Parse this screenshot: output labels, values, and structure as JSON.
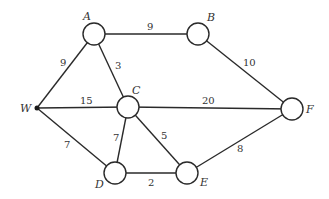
{
  "diagram": {
    "type": "weighted-undirected-graph",
    "nodes": [
      {
        "id": "A",
        "label": "A",
        "x": 94,
        "y": 34,
        "shape": "circle",
        "label_x": 83,
        "label_y": 20
      },
      {
        "id": "B",
        "label": "B",
        "x": 198,
        "y": 34,
        "shape": "circle",
        "label_x": 207,
        "label_y": 21
      },
      {
        "id": "W",
        "label": "W",
        "x": 37,
        "y": 108,
        "shape": "dot",
        "label_x": 20,
        "label_y": 112
      },
      {
        "id": "C",
        "label": "C",
        "x": 128,
        "y": 107,
        "shape": "circle",
        "label_x": 132,
        "label_y": 94
      },
      {
        "id": "F",
        "label": "F",
        "x": 292,
        "y": 109,
        "shape": "circle",
        "label_x": 306,
        "label_y": 113
      },
      {
        "id": "D",
        "label": "D",
        "x": 115,
        "y": 173,
        "shape": "circle",
        "label_x": 95,
        "label_y": 188
      },
      {
        "id": "E",
        "label": "E",
        "x": 187,
        "y": 173,
        "shape": "circle",
        "label_x": 200,
        "label_y": 186
      }
    ],
    "edges": [
      {
        "from": "A",
        "to": "B",
        "weight": "9",
        "label_x": 147,
        "label_y": 30
      },
      {
        "from": "W",
        "to": "A",
        "weight": "9",
        "label_x": 60,
        "label_y": 66
      },
      {
        "from": "A",
        "to": "C",
        "weight": "3",
        "label_x": 115,
        "label_y": 69
      },
      {
        "from": "B",
        "to": "F",
        "weight": "10",
        "label_x": 243,
        "label_y": 66
      },
      {
        "from": "W",
        "to": "C",
        "weight": "15",
        "label_x": 80,
        "label_y": 104
      },
      {
        "from": "C",
        "to": "F",
        "weight": "20",
        "label_x": 202,
        "label_y": 104
      },
      {
        "from": "W",
        "to": "D",
        "weight": "7",
        "label_x": 64,
        "label_y": 148
      },
      {
        "from": "C",
        "to": "D",
        "weight": "7",
        "label_x": 113,
        "label_y": 141
      },
      {
        "from": "C",
        "to": "E",
        "weight": "5",
        "label_x": 161,
        "label_y": 139
      },
      {
        "from": "E",
        "to": "F",
        "weight": "8",
        "label_x": 237,
        "label_y": 152
      },
      {
        "from": "D",
        "to": "E",
        "weight": "2",
        "label_x": 148,
        "label_y": 186
      }
    ],
    "node_radius": 11,
    "colors": {
      "stroke": "#2a2a2a",
      "text": "#333333",
      "background": "#ffffff"
    }
  }
}
